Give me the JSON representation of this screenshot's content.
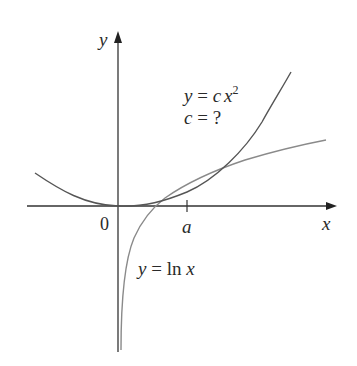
{
  "figure": {
    "labels": {
      "y_axis": "y",
      "x_axis": "x",
      "origin": "0",
      "tick_a": "a",
      "parabola_eq_lhs": "y",
      "parabola_eq_mid": " = ",
      "parabola_eq_c": "c",
      "parabola_eq_x": "x",
      "parabola_eq_exp": "2",
      "c_question_c": "c",
      "c_question_rest": " = ?",
      "log_eq_lhs": "y",
      "log_eq_mid": " = ln ",
      "log_eq_x": "x"
    },
    "colors": {
      "axis": "#333333",
      "parabola": "#555555",
      "log_curve": "#8a8a8a",
      "text": "#2a2a2a"
    },
    "curves": [
      {
        "name": "parabola",
        "equation": "y = c x^2",
        "note": "tangent to ln x at x = a"
      },
      {
        "name": "log",
        "equation": "y = ln x"
      }
    ]
  }
}
